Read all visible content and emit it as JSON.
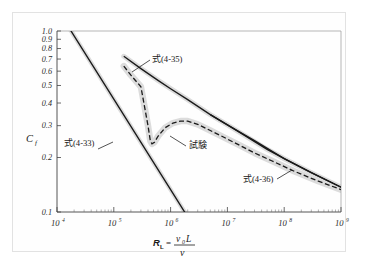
{
  "figure": {
    "background_color": "#ffffff",
    "frame_color": "#e2e2e2"
  },
  "chart_data": {
    "type": "line",
    "title": "",
    "xlabel": "R_L = v0 L / nu",
    "ylabel": "Cf",
    "xscale": "log",
    "yscale": "log",
    "xlim": [
      10000,
      1000000000
    ],
    "ylim": [
      0.1,
      1.0
    ],
    "grid": false,
    "legend_position": "inline-annotations",
    "xticks": [
      {
        "value": 10000,
        "mantissa": "10",
        "exponent": "4"
      },
      {
        "value": 100000,
        "mantissa": "10",
        "exponent": "5"
      },
      {
        "value": 1000000,
        "mantissa": "10",
        "exponent": "6"
      },
      {
        "value": 10000000,
        "mantissa": "10",
        "exponent": "7"
      },
      {
        "value": 100000000,
        "mantissa": "10",
        "exponent": "8"
      },
      {
        "value": 1000000000,
        "mantissa": "10",
        "exponent": "9"
      }
    ],
    "yticks": [
      {
        "value": 1.0,
        "label": "1.0"
      },
      {
        "value": 0.9,
        "label": "0.9"
      },
      {
        "value": 0.8,
        "label": "0.8"
      },
      {
        "value": 0.7,
        "label": "0.7"
      },
      {
        "value": 0.6,
        "label": "0.6"
      },
      {
        "value": 0.5,
        "label": "0.5"
      },
      {
        "value": 0.4,
        "label": "0.4"
      },
      {
        "value": 0.3,
        "label": "0.3"
      },
      {
        "value": 0.2,
        "label": "0.2"
      },
      {
        "value": 0.1,
        "label": "0.1"
      }
    ],
    "series": [
      {
        "name": "laminar-line-eq-4-33",
        "label": "式(4-33)",
        "style": "solid",
        "color": "#1a1a1a",
        "points": [
          [
            10000,
            1.33
          ],
          [
            20000,
            0.94
          ],
          [
            50000,
            0.595
          ],
          [
            100000,
            0.42
          ],
          [
            200000,
            0.297
          ],
          [
            400000,
            0.21
          ],
          [
            700000,
            0.159
          ],
          [
            1000000,
            0.133
          ],
          [
            1800000,
            0.099
          ]
        ]
      },
      {
        "name": "turbulent-line-eq-4-35",
        "label": "式(4-35)",
        "style": "solid",
        "color": "#1a1a1a",
        "points": [
          [
            150000,
            0.725
          ],
          [
            300000,
            0.62
          ],
          [
            600000,
            0.534
          ],
          [
            1000000,
            0.48
          ],
          [
            2000000,
            0.418
          ],
          [
            5000000,
            0.345
          ],
          [
            10000000,
            0.303
          ],
          [
            20000000,
            0.265
          ],
          [
            50000000,
            0.222
          ],
          [
            100000000,
            0.197
          ],
          [
            300000000,
            0.165
          ],
          [
            1000000000,
            0.137
          ]
        ]
      },
      {
        "name": "schoenherr-line-eq-4-36",
        "label": "式(4-36)",
        "style": "solid",
        "color": "#1a1a1a",
        "points": [
          [
            5000000,
            0.345
          ],
          [
            10000000,
            0.303
          ],
          [
            30000000,
            0.248
          ],
          [
            100000000,
            0.197
          ],
          [
            300000000,
            0.165
          ],
          [
            1000000000,
            0.137
          ]
        ]
      },
      {
        "name": "experiment-curve",
        "label": "試験",
        "style": "dashed",
        "color": "#1a1a1a",
        "band_color": "#d8d8d8",
        "points": [
          [
            150000,
            0.64
          ],
          [
            200000,
            0.57
          ],
          [
            300000,
            0.492
          ],
          [
            400000,
            0.3
          ],
          [
            440000,
            0.247
          ],
          [
            470000,
            0.238
          ],
          [
            520000,
            0.243
          ],
          [
            600000,
            0.262
          ],
          [
            800000,
            0.292
          ],
          [
            1100000,
            0.31
          ],
          [
            1500000,
            0.318
          ],
          [
            2000000,
            0.318
          ],
          [
            3000000,
            0.305
          ],
          [
            5000000,
            0.282
          ],
          [
            8000000,
            0.262
          ],
          [
            15000000,
            0.237
          ],
          [
            30000000,
            0.212
          ],
          [
            60000000,
            0.192
          ],
          [
            150000000,
            0.168
          ],
          [
            400000000,
            0.148
          ],
          [
            1000000000,
            0.133
          ]
        ]
      }
    ],
    "annotations": [
      {
        "name": "eq-4-35",
        "text": "式",
        "paren": "(4-35)",
        "x_px": 152,
        "y_px": 62
      },
      {
        "name": "eq-4-33",
        "text": "式",
        "paren": "(4-33)",
        "x_px": 64,
        "y_px": 146
      },
      {
        "name": "experiment",
        "text": "試験",
        "paren": "",
        "x_px": 189,
        "y_px": 148
      },
      {
        "name": "eq-4-36",
        "text": "式",
        "paren": "(4-36)",
        "x_px": 243,
        "y_px": 182
      }
    ]
  },
  "axis_labels": {
    "y_symbol": "C",
    "y_subscript": "f",
    "x_symbol": "R",
    "x_subscript": "L",
    "x_equals": "=",
    "x_num_v": "v",
    "x_num_v_sub": "0",
    "x_num_L": "L",
    "x_den": "ν"
  }
}
